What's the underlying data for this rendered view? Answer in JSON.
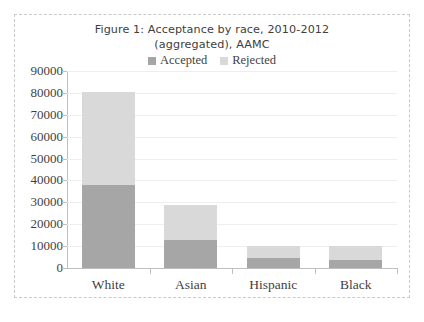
{
  "figure": {
    "title": "Figure 1: Acceptance by race, 2010-2012\n(aggregated), AAMC"
  },
  "legend": {
    "position": "top-center",
    "entries": [
      {
        "label": "Accepted",
        "color": "#a6a6a6"
      },
      {
        "label": "Rejected",
        "color": "#d9d9d9"
      }
    ]
  },
  "axes": {
    "y_ticks": [
      "90000",
      "80000",
      "70000",
      "60000",
      "50000",
      "40000",
      "30000",
      "20000",
      "10000",
      "0"
    ],
    "x_ticks": [
      "White",
      "Asian",
      "Hispanic",
      "Black"
    ]
  },
  "chart_data": {
    "type": "bar",
    "subtype": "stacked",
    "title": "Figure 1: Acceptance by race, 2010-2012 (aggregated), AAMC",
    "xlabel": "",
    "ylabel": "",
    "ylim": [
      0,
      90000
    ],
    "ytick_step": 10000,
    "grid": true,
    "legend_position": "top-center",
    "categories": [
      "White",
      "Asian",
      "Hispanic",
      "Black"
    ],
    "series": [
      {
        "name": "Accepted",
        "color": "#a6a6a6",
        "values": [
          38000,
          12600,
          4800,
          3700
        ]
      },
      {
        "name": "Rejected",
        "color": "#d9d9d9",
        "values": [
          42200,
          16400,
          5200,
          6400
        ]
      }
    ],
    "totals": [
      80200,
      29000,
      10000,
      10100
    ]
  }
}
